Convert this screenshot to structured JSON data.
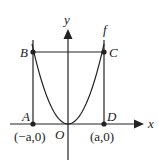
{
  "diagram": {
    "function_label": "f",
    "axes": {
      "x_label": "x",
      "y_label": "y",
      "origin_label": "O"
    },
    "points": [
      {
        "name": "A",
        "label": "A"
      },
      {
        "name": "B",
        "label": "B"
      },
      {
        "name": "C",
        "label": "C"
      },
      {
        "name": "D",
        "label": "D"
      }
    ],
    "coordinate_labels": {
      "left": "(−a,0)",
      "right": "(a,0)"
    },
    "colors": {
      "stroke": "#222222",
      "background": "#ffffff"
    }
  }
}
